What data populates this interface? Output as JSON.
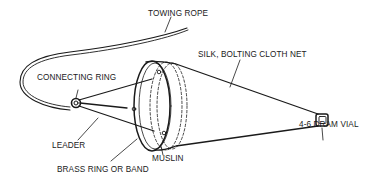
{
  "diagram": {
    "colors": {
      "line": "#1a1a1a",
      "background": "#ffffff"
    },
    "labels": {
      "towing_rope": "TOWING ROPE",
      "silk_net": "SILK, BOLTING CLOTH NET",
      "connecting_ring": "CONNECTING RING",
      "vial": "4-6 DRAM VIAL",
      "leader": "LEADER",
      "muslin": "MUSLIN",
      "brass_ring": "BRASS RING OR BAND"
    }
  }
}
